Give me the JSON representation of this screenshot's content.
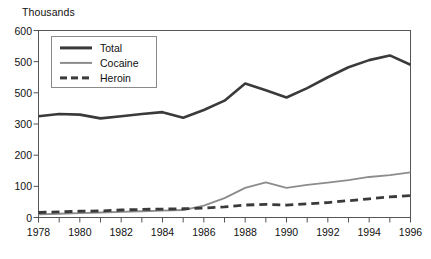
{
  "chart_data": {
    "type": "line",
    "title": "",
    "ylabel": "Thousands",
    "xlabel": "",
    "ylim": [
      0,
      600
    ],
    "xlim": [
      1978,
      1996
    ],
    "grid": false,
    "legend_position": "top-left",
    "y_tick_labels": [
      "600",
      "500",
      "500",
      "300",
      "200",
      "100",
      "0"
    ],
    "y_tick_values": [
      600,
      500,
      400,
      300,
      200,
      100,
      0
    ],
    "x_tick_labels": [
      "1978",
      "1980",
      "1982",
      "1984",
      "1986",
      "1988",
      "1990",
      "1992",
      "1994",
      "1996"
    ],
    "x_minor_ticks": [
      1979,
      1981,
      1983,
      1985,
      1987,
      1989,
      1991,
      1993,
      1995
    ],
    "x": [
      1978,
      1979,
      1980,
      1981,
      1982,
      1983,
      1984,
      1985,
      1986,
      1987,
      1988,
      1989,
      1990,
      1991,
      1992,
      1993,
      1994,
      1995,
      1996
    ],
    "series": [
      {
        "name": "Total",
        "style": "solid-thick",
        "color": "#3a3a3a",
        "values": [
          325,
          332,
          330,
          318,
          325,
          332,
          338,
          320,
          345,
          375,
          430,
          408,
          385,
          415,
          450,
          482,
          505,
          520,
          490
        ]
      },
      {
        "name": "Cocaine",
        "style": "solid-thin",
        "color": "#8c8c8c",
        "values": [
          10,
          12,
          14,
          16,
          18,
          20,
          22,
          24,
          38,
          62,
          95,
          113,
          95,
          105,
          112,
          120,
          130,
          136,
          145
        ]
      },
      {
        "name": "Heroin",
        "style": "dashed",
        "color": "#3a3a3a",
        "values": [
          16,
          18,
          20,
          21,
          24,
          26,
          27,
          28,
          30,
          34,
          40,
          42,
          40,
          44,
          48,
          54,
          60,
          66,
          70
        ]
      }
    ]
  },
  "legend": {
    "items": [
      {
        "label": "Total"
      },
      {
        "label": "Cocaine"
      },
      {
        "label": "Heroin"
      }
    ]
  },
  "colors": {
    "total": "#3a3a3a",
    "cocaine": "#8c8c8c",
    "heroin": "#3a3a3a",
    "frame": "#555555",
    "background": "#ffffff"
  }
}
